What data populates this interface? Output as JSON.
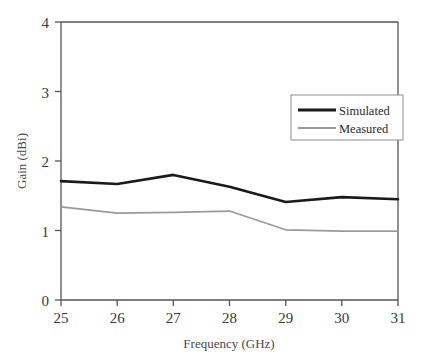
{
  "chart_data": {
    "type": "line",
    "title": "",
    "xlabel": "Frequency (GHz)",
    "ylabel": "Gain (dBi)",
    "x": [
      25,
      26,
      27,
      28,
      29,
      30,
      31
    ],
    "xlim": [
      25,
      31
    ],
    "ylim": [
      0,
      4
    ],
    "xticks": [
      "25",
      "26",
      "27",
      "28",
      "29",
      "30",
      "31"
    ],
    "yticks": [
      "0",
      "1",
      "2",
      "3",
      "4"
    ],
    "grid": false,
    "legend_position": "upper right",
    "series": [
      {
        "name": "Simulated",
        "color": "#1a1a1a",
        "linewidth": 2.6,
        "values": [
          1.71,
          1.67,
          1.8,
          1.63,
          1.41,
          1.48,
          1.45
        ]
      },
      {
        "name": "Measured",
        "color": "#9a9a9a",
        "linewidth": 1.7,
        "values": [
          1.34,
          1.25,
          1.26,
          1.28,
          1.01,
          0.99,
          0.99
        ]
      }
    ]
  },
  "axes": {
    "x_title": "Frequency (GHz)",
    "y_title": "Gain (dBi)",
    "x_tick_labels": [
      "25",
      "26",
      "27",
      "28",
      "29",
      "30",
      "31"
    ],
    "y_tick_labels": [
      "0",
      "1",
      "2",
      "3",
      "4"
    ]
  },
  "legend": {
    "entries": [
      {
        "label": "Simulated",
        "color": "#1a1a1a"
      },
      {
        "label": "Measured",
        "color": "#9a9a9a"
      }
    ]
  },
  "colors": {
    "simulated": "#1a1a1a",
    "measured": "#9a9a9a",
    "axis": "#555555",
    "text": "#3a3a3a",
    "background": "#ffffff"
  }
}
